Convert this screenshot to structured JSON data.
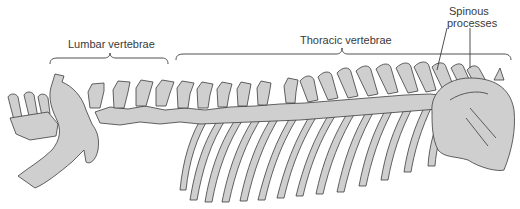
{
  "figure": {
    "colors": {
      "bone_fill": "#cfcfcf",
      "bone_stroke": "#3c3c3c",
      "label_text": "#3a3a3a",
      "background": "#ffffff"
    }
  },
  "labels": {
    "lumbar": "Lumbar vertebrae",
    "thoracic": "Thoracic vertebrae",
    "spinous_line1": "Spinous",
    "spinous_line2": "processes"
  },
  "structures": [
    {
      "name": "pelvis"
    },
    {
      "name": "lumbar-vertebrae",
      "count": 7
    },
    {
      "name": "thoracic-vertebrae",
      "count": 13
    },
    {
      "name": "ribs"
    },
    {
      "name": "scapula"
    }
  ]
}
